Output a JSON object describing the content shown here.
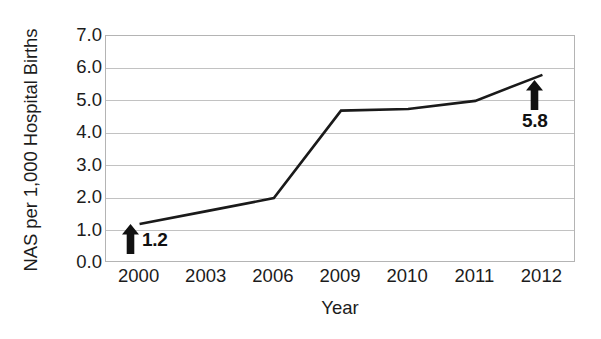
{
  "chart_data": {
    "type": "line",
    "title": "",
    "subtitle": "",
    "xlabel": "Year",
    "ylabel": "NAS per 1,000 Hospital Births",
    "categories": [
      "2000",
      "2003",
      "2006",
      "2009",
      "2010",
      "2011",
      "2012"
    ],
    "values": [
      1.2,
      1.6,
      2.0,
      4.7,
      4.75,
      5.0,
      5.8
    ],
    "series": [
      {
        "name": "NAS rate",
        "values": [
          1.2,
          1.6,
          2.0,
          4.7,
          4.75,
          5.0,
          5.8
        ],
        "color": "#1a1a1a"
      }
    ],
    "ylim": [
      0.0,
      7.0
    ],
    "ytick_labels": [
      "7.0",
      "6.0",
      "5.0",
      "4.0",
      "3.0",
      "2.0",
      "1.0",
      "0.0"
    ],
    "ytick_values": [
      7.0,
      6.0,
      5.0,
      4.0,
      3.0,
      2.0,
      1.0,
      0.0
    ],
    "ytick_step": 1.0,
    "grid": "horizontal",
    "legend": "none",
    "annotations": [
      {
        "id": "annotation-2000",
        "label": "1.2",
        "value": 1.2,
        "category": "2000",
        "icon": "up-arrow-icon",
        "position": "right-of-arrow"
      },
      {
        "id": "annotation-2012",
        "label": "5.8",
        "value": 5.8,
        "category": "2012",
        "icon": "up-arrow-icon",
        "position": "below-arrow"
      }
    ],
    "colors": {
      "line": "#1a1a1a",
      "grid": "#c2c2c2",
      "frame": "#b4b4b4",
      "text": "#1c1c1c",
      "annotation": "#111111",
      "background": "#ffffff"
    }
  }
}
